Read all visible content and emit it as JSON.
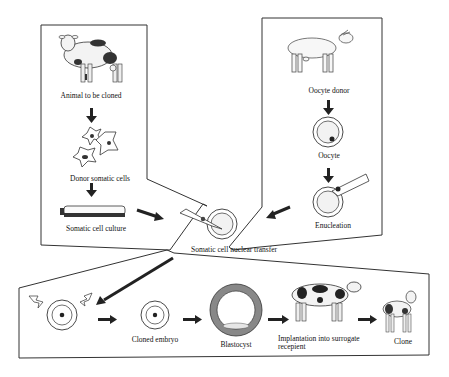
{
  "diagram": {
    "type": "process-flow",
    "colors": {
      "line": "#222222",
      "fill_light": "#eeeeee",
      "fill_dark": "#222222",
      "background": "#ffffff"
    }
  },
  "donor_panel": {
    "animal_label": "Animal to be cloned",
    "cells_label": "Donor somatic cells",
    "culture_label": "Somatic cell culture"
  },
  "oocyte_panel": {
    "donor_label": "Oocyte donor",
    "oocyte_label": "Oocyte",
    "enucleation_label": "Enucleation"
  },
  "center": {
    "transfer_label": "Somatic cell nuclear transfer"
  },
  "bottom_panel": {
    "embryo_label": "Cloned embryo",
    "blastocyst_label": "Blastocyst",
    "implant_label_line1": "Implantation into surrogate",
    "implant_label_line2": "recepient",
    "clone_label": "Clone"
  }
}
